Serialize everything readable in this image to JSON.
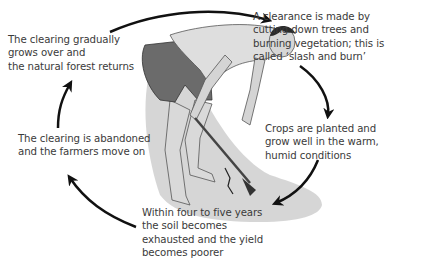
{
  "diagram": {
    "type": "cycle",
    "accent_colors": {
      "arrow": "#111111",
      "text": "#3a3a3a",
      "ground": "#c8c8c8",
      "shorts": "#666666",
      "skin": "#cfcfcf",
      "hair": "#2a2a2a"
    },
    "steps": [
      {
        "id": "clearance",
        "lines": [
          "A clearance is made by",
          "cutting down trees and",
          "burning vegetation; this is",
          "called ‘slash and burn’"
        ]
      },
      {
        "id": "crops",
        "lines": [
          "Crops are planted and",
          "grow well in the warm,",
          "humid conditions"
        ]
      },
      {
        "id": "exhausted",
        "lines": [
          "Within four to five years",
          "the soil becomes",
          "exhausted and the yield",
          "becomes poorer"
        ]
      },
      {
        "id": "abandoned",
        "lines": [
          "The clearing is abandoned",
          "and the farmers move on"
        ]
      },
      {
        "id": "regrowth",
        "lines": [
          "The clearing gradually",
          "grows over and",
          "the natural forest returns"
        ]
      }
    ],
    "illustration": "farmer-with-hoe"
  }
}
